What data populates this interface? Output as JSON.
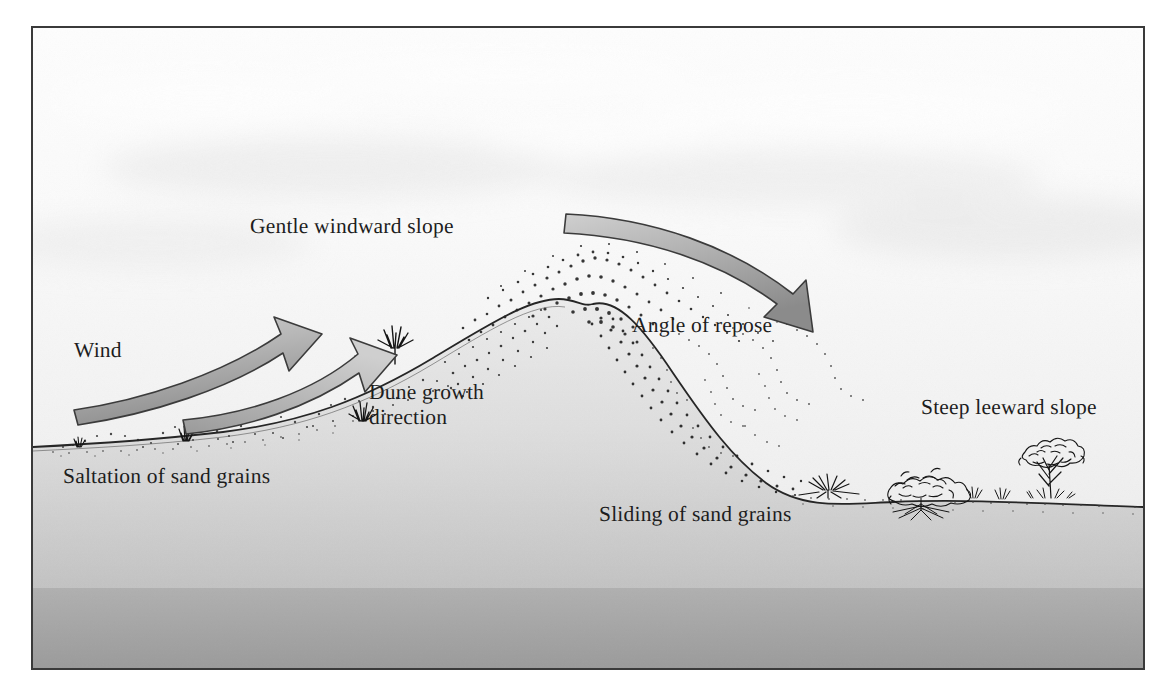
{
  "figure": {
    "title_alt": "Cross-section of a sand dune showing wind transport processes",
    "frame_border_color": "#3a3a3a",
    "background_color": "#ffffff"
  },
  "palette": {
    "sky_top": "#fcfcfc",
    "sky_bottom": "#ededed",
    "ground_top": "#e6e6e6",
    "ground_bottom": "#9d9d9d",
    "arrow_fill_light": "#c9c9c9",
    "arrow_fill_dark": "#8e8e8e",
    "arrow_stroke": "#3b3b3b",
    "terrain_line": "#2c2c2c",
    "sand_grain": "#2a2a2a",
    "vegetation": "#1a1a1a",
    "text": "#1d1d1d"
  },
  "labels": [
    {
      "id": "gentle-windward-slope",
      "text": "Gentle windward slope",
      "x": 248,
      "y": 212,
      "size": 21.5
    },
    {
      "id": "wind",
      "text": "Wind",
      "x": 72,
      "y": 336,
      "size": 21.5
    },
    {
      "id": "dune-growth-direction",
      "text": "Dune growth\ndirection",
      "x": 367,
      "y": 378,
      "size": 21.5
    },
    {
      "id": "angle-of-repose",
      "text": "Angle of repose",
      "x": 630,
      "y": 311,
      "size": 21.5
    },
    {
      "id": "steep-leeward-slope",
      "text": "Steep leeward slope",
      "x": 919,
      "y": 393,
      "size": 21.5
    },
    {
      "id": "saltation-of-sand-grains",
      "text": "Saltation of sand grains",
      "x": 61,
      "y": 462,
      "size": 21.5
    },
    {
      "id": "sliding-of-sand-grains",
      "text": "Sliding of sand grains",
      "x": 597,
      "y": 500,
      "size": 21.5
    }
  ],
  "diagram_elements": {
    "arrows": [
      {
        "id": "wind-arrow-windward",
        "name": "Wind",
        "description": "Large curved ribbon arrow sweeping up the gentle windward slope from lower-left to upper-right",
        "direction": "up-right"
      },
      {
        "id": "wind-arrow-leeward",
        "name": "Wind over crest",
        "description": "Large curved ribbon arrow sweeping over the dune crest and down toward the leeward slope",
        "direction": "down-right"
      },
      {
        "id": "dune-growth-arrow",
        "name": "Dune growth direction",
        "description": "Curved ribbon arrow pointing up-right toward the dune crest",
        "direction": "up-right"
      }
    ],
    "terrain": [
      {
        "id": "windward-slope",
        "name": "Gentle windward slope",
        "steepness": "gentle"
      },
      {
        "id": "dune-crest",
        "name": "Dune crest",
        "x": 565,
        "y": 297
      },
      {
        "id": "leeward-slope",
        "name": "Steep leeward slope",
        "steepness": "steep",
        "note": "angle of repose"
      }
    ],
    "processes": [
      {
        "id": "saltation",
        "name": "Saltation of sand grains",
        "zone": "windward slope and flat upwind ground"
      },
      {
        "id": "sliding",
        "name": "Sliding of sand grains",
        "zone": "leeward slope face"
      }
    ],
    "vegetation": [
      {
        "id": "grass-tuft-left",
        "type": "grass-tuft",
        "x": 75,
        "y": 441
      },
      {
        "id": "grass-tuft-mid-left",
        "type": "grass-tuft",
        "x": 182,
        "y": 434
      },
      {
        "id": "grass-tuft-slope-a",
        "type": "grass-tuft",
        "x": 358,
        "y": 348
      },
      {
        "id": "grass-tuft-slope-b",
        "type": "grass-tuft",
        "x": 392,
        "y": 328
      },
      {
        "id": "grass-tuft-lee-base",
        "type": "grass-tuft",
        "x": 845,
        "y": 495
      },
      {
        "id": "shrub-lee",
        "type": "shrub",
        "x": 920,
        "y": 487
      },
      {
        "id": "tree-lee",
        "type": "small-tree",
        "x": 1048,
        "y": 480
      }
    ]
  }
}
